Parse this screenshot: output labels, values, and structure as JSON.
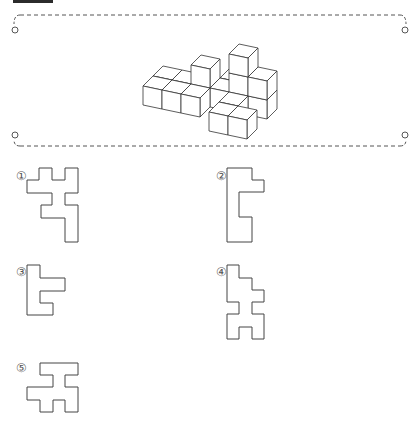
{
  "header": {
    "tab_color": "#2b2b2b"
  },
  "frame": {
    "style": "dashed",
    "color": "#555555",
    "top_y": 15,
    "bottom_y": 146,
    "left_x": 20,
    "right_x": 400,
    "rings": [
      [
        15,
        30
      ],
      [
        405,
        30
      ],
      [
        15,
        135
      ],
      [
        405,
        135
      ]
    ]
  },
  "figure": {
    "origin": [
      143,
      105
    ],
    "axis_x": [
      19,
      4
    ],
    "axis_depth": [
      10,
      -10
    ],
    "axis_up": [
      0,
      -19
    ],
    "cubes": [
      [
        3,
        2,
        0
      ],
      [
        4,
        1,
        0
      ],
      [
        4,
        1,
        1
      ],
      [
        4,
        1,
        2
      ],
      [
        5,
        1,
        0
      ],
      [
        5,
        1,
        1
      ],
      [
        3,
        1,
        0
      ],
      [
        2,
        1,
        0
      ],
      [
        2,
        1,
        1
      ],
      [
        1,
        1,
        0
      ],
      [
        0,
        1,
        0
      ],
      [
        4,
        0,
        0
      ],
      [
        2,
        0,
        0
      ],
      [
        1,
        0,
        0
      ],
      [
        0,
        0,
        0
      ],
      [
        4,
        -1,
        0
      ],
      [
        5,
        -1,
        0
      ]
    ]
  },
  "options": [
    {
      "label": "①",
      "label_pos": [
        16,
        170
      ],
      "points": [
        [
          39,
          168
        ],
        [
          52,
          168
        ],
        [
          52,
          180
        ],
        [
          65,
          180
        ],
        [
          65,
          168
        ],
        [
          78,
          168
        ],
        [
          78,
          193
        ],
        [
          65,
          193
        ],
        [
          65,
          205
        ],
        [
          78,
          205
        ],
        [
          78,
          242
        ],
        [
          65,
          242
        ],
        [
          65,
          218
        ],
        [
          41,
          218
        ],
        [
          41,
          205
        ],
        [
          52,
          205
        ],
        [
          52,
          193
        ],
        [
          27,
          193
        ],
        [
          27,
          180
        ],
        [
          39,
          180
        ]
      ]
    },
    {
      "label": "②",
      "label_pos": [
        216,
        170
      ],
      "points": [
        [
          227,
          168
        ],
        [
          252,
          168
        ],
        [
          252,
          180
        ],
        [
          264,
          180
        ],
        [
          264,
          192
        ],
        [
          239,
          192
        ],
        [
          239,
          217
        ],
        [
          252,
          217
        ],
        [
          252,
          242
        ],
        [
          227,
          242
        ]
      ]
    },
    {
      "label": "③",
      "label_pos": [
        16,
        266
      ],
      "points": [
        [
          27,
          265
        ],
        [
          40,
          265
        ],
        [
          40,
          278
        ],
        [
          65,
          278
        ],
        [
          65,
          291
        ],
        [
          40,
          291
        ],
        [
          40,
          303
        ],
        [
          53,
          303
        ],
        [
          53,
          315
        ],
        [
          27,
          315
        ]
      ]
    },
    {
      "label": "④",
      "label_pos": [
        216,
        266
      ],
      "points": [
        [
          227,
          265
        ],
        [
          239,
          265
        ],
        [
          239,
          278
        ],
        [
          252,
          278
        ],
        [
          252,
          290
        ],
        [
          264,
          290
        ],
        [
          264,
          302
        ],
        [
          252,
          302
        ],
        [
          252,
          314
        ],
        [
          264,
          314
        ],
        [
          264,
          339
        ],
        [
          252,
          339
        ],
        [
          252,
          327
        ],
        [
          239,
          327
        ],
        [
          239,
          339
        ],
        [
          227,
          339
        ],
        [
          227,
          314
        ],
        [
          239,
          314
        ],
        [
          239,
          302
        ],
        [
          227,
          302
        ]
      ]
    },
    {
      "label": "⑤",
      "label_pos": [
        16,
        362
      ],
      "points": [
        [
          40,
          363
        ],
        [
          78,
          363
        ],
        [
          78,
          375
        ],
        [
          65,
          375
        ],
        [
          65,
          387
        ],
        [
          78,
          387
        ],
        [
          78,
          412
        ],
        [
          65,
          412
        ],
        [
          65,
          400
        ],
        [
          53,
          400
        ],
        [
          53,
          412
        ],
        [
          40,
          412
        ],
        [
          40,
          400
        ],
        [
          27,
          400
        ],
        [
          27,
          387
        ],
        [
          53,
          387
        ],
        [
          53,
          375
        ],
        [
          40,
          375
        ]
      ]
    }
  ]
}
